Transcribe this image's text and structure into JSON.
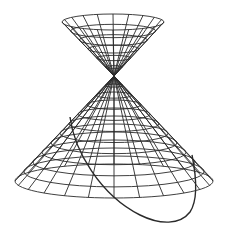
{
  "figure": {
    "description": "Wireframe double cone (two nappes) intersected by a slanted plane, producing an elliptical conic section curve on the lower nappe",
    "stroke_color": "#2a2a2a",
    "background_color": "#ffffff"
  },
  "apex": {
    "x": 114,
    "y": 76
  },
  "upper_nappe": {
    "rim_center": {
      "x": 113,
      "y": 22
    },
    "rim_rx": 51,
    "rim_ry": 8,
    "rings": 6,
    "generators": 20,
    "stroke_width": 0.9
  },
  "lower_nappe": {
    "rim_center": {
      "x": 114,
      "y": 181
    },
    "rim_rx": 99,
    "rim_ry": 17,
    "rings": 11,
    "generators": 24,
    "stroke_width": 0.9
  },
  "conic_section": {
    "type": "ellipse",
    "path": "M 70 117 C 74 150, 100 195, 140 215 C 160 225, 180 225, 190 212 C 198 200, 196 175, 192 155",
    "stroke_width": 1.4
  }
}
